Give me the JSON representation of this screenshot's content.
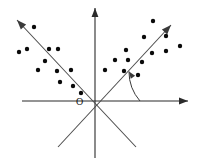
{
  "figure": {
    "width": 197,
    "height": 167,
    "background_color": "#ffffff",
    "origin_label": "O",
    "origin_label_position": {
      "x": 76,
      "y": 105
    }
  },
  "colors": {
    "axis": "#2b2b2b",
    "pc_line": "#4a4a4a",
    "arc": "#3a3a3a",
    "dot": "#0a0a0a",
    "background": "#ffffff"
  },
  "chart_data": {
    "type": "scatter",
    "title": "",
    "xlabel": "",
    "ylabel": "",
    "grid": false,
    "legend": "none",
    "axes": {
      "origin": {
        "x": 95,
        "y": 101
      },
      "x_axis": {
        "name": "horizontal-axis",
        "from": {
          "x": 22,
          "y": 101
        },
        "to": {
          "x": 188,
          "y": 101
        },
        "arrow_at": "end"
      },
      "y_axis": {
        "name": "vertical-axis",
        "from": {
          "x": 95,
          "y": 158
        },
        "to": {
          "x": 95,
          "y": 8
        },
        "arrow_at": "end"
      }
    },
    "principal_axes": [
      {
        "name": "first-principal-axis",
        "direction_deg": 41,
        "from": {
          "x": 58,
          "y": 147
        },
        "to": {
          "x": 171,
          "y": 25
        },
        "arrow_at": "end"
      },
      {
        "name": "second-principal-axis",
        "direction_deg": 139,
        "from": {
          "x": 136,
          "y": 147
        },
        "to": {
          "x": 17,
          "y": 20
        },
        "arrow_at": "end"
      }
    ],
    "angle_marker": {
      "name": "rotation-angle-arc",
      "vertex": {
        "x": 95,
        "y": 101
      },
      "radius": 45,
      "start_deg": 0,
      "end_deg": 41,
      "arrow_at": "end",
      "label": ""
    },
    "dot_radius": 2.2,
    "series": [
      {
        "name": "cluster-upper-left",
        "points": [
          {
            "x": 34,
            "y": 27
          },
          {
            "x": 27,
            "y": 49
          },
          {
            "x": 49,
            "y": 49
          },
          {
            "x": 58,
            "y": 49
          },
          {
            "x": 38,
            "y": 70
          },
          {
            "x": 57,
            "y": 71
          },
          {
            "x": 71,
            "y": 70
          },
          {
            "x": 60,
            "y": 82
          },
          {
            "x": 73,
            "y": 86
          },
          {
            "x": 19,
            "y": 52
          },
          {
            "x": 45,
            "y": 61
          },
          {
            "x": 81,
            "y": 93
          }
        ]
      },
      {
        "name": "cluster-upper-right",
        "points": [
          {
            "x": 153,
            "y": 21
          },
          {
            "x": 144,
            "y": 37
          },
          {
            "x": 166,
            "y": 36
          },
          {
            "x": 126,
            "y": 50
          },
          {
            "x": 152,
            "y": 53
          },
          {
            "x": 166,
            "y": 51
          },
          {
            "x": 115,
            "y": 60
          },
          {
            "x": 128,
            "y": 60
          },
          {
            "x": 142,
            "y": 62
          },
          {
            "x": 105,
            "y": 70
          },
          {
            "x": 124,
            "y": 71
          },
          {
            "x": 138,
            "y": 75
          },
          {
            "x": 180,
            "y": 46
          }
        ]
      }
    ]
  }
}
